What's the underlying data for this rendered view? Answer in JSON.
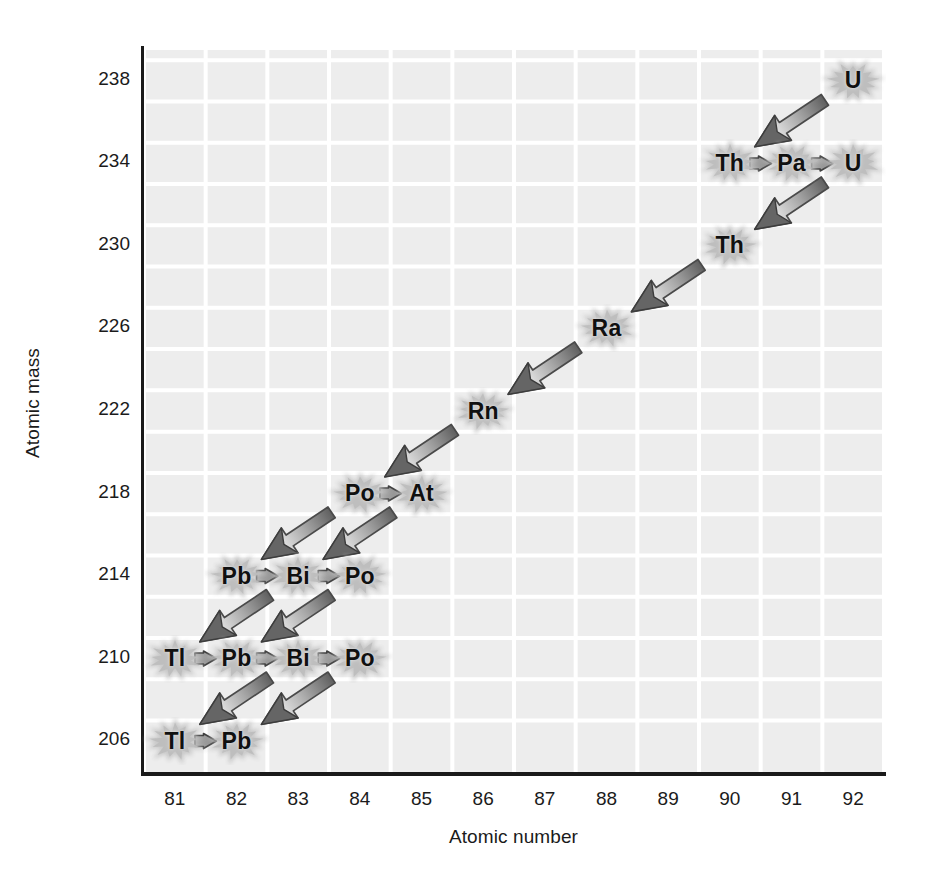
{
  "figure": {
    "background": "#ffffff",
    "panel_color": "#ededed",
    "grid_color": "#ffffff",
    "axis_color": "#1a1a1a"
  },
  "axes": {
    "xlabel": "Atomic number",
    "ylabel": "Atomic mass",
    "xticks": [
      "81",
      "82",
      "83",
      "84",
      "85",
      "86",
      "87",
      "88",
      "89",
      "90",
      "91",
      "92"
    ],
    "yticks": [
      "238",
      "234",
      "230",
      "226",
      "222",
      "218",
      "214",
      "210",
      "206"
    ],
    "xlim": [
      80.5,
      92.5
    ],
    "ylim": [
      204.5,
      239.5
    ]
  },
  "chart_data": {
    "type": "scatter",
    "xlabel": "Atomic number",
    "ylabel": "Atomic mass",
    "xlim": [
      80.5,
      92.5
    ],
    "ylim": [
      204.5,
      239.5
    ],
    "xticks": [
      81,
      82,
      83,
      84,
      85,
      86,
      87,
      88,
      89,
      90,
      91,
      92
    ],
    "yticks": [
      238,
      234,
      230,
      226,
      222,
      218,
      214,
      210,
      206
    ],
    "grid": true,
    "legend": "none",
    "nodes": [
      {
        "symbol": "U",
        "z": 92,
        "a": 238
      },
      {
        "symbol": "Th",
        "z": 90,
        "a": 234
      },
      {
        "symbol": "Pa",
        "z": 91,
        "a": 234
      },
      {
        "symbol": "U",
        "z": 92,
        "a": 234
      },
      {
        "symbol": "Th",
        "z": 90,
        "a": 230
      },
      {
        "symbol": "Ra",
        "z": 88,
        "a": 226
      },
      {
        "symbol": "Rn",
        "z": 86,
        "a": 222
      },
      {
        "symbol": "Po",
        "z": 84,
        "a": 218
      },
      {
        "symbol": "At",
        "z": 85,
        "a": 218
      },
      {
        "symbol": "Pb",
        "z": 82,
        "a": 214
      },
      {
        "symbol": "Bi",
        "z": 83,
        "a": 214
      },
      {
        "symbol": "Po",
        "z": 84,
        "a": 214
      },
      {
        "symbol": "Tl",
        "z": 81,
        "a": 210
      },
      {
        "symbol": "Pb",
        "z": 82,
        "a": 210
      },
      {
        "symbol": "Bi",
        "z": 83,
        "a": 210
      },
      {
        "symbol": "Po",
        "z": 84,
        "a": 210
      },
      {
        "symbol": "Tl",
        "z": 81,
        "a": 206
      },
      {
        "symbol": "Pb",
        "z": 82,
        "a": 206
      }
    ],
    "transitions": [
      {
        "kind": "alpha",
        "from": {
          "z": 92,
          "a": 238
        },
        "to": {
          "z": 90,
          "a": 234
        }
      },
      {
        "kind": "beta",
        "from": {
          "z": 90,
          "a": 234
        },
        "to": {
          "z": 91,
          "a": 234
        }
      },
      {
        "kind": "beta",
        "from": {
          "z": 91,
          "a": 234
        },
        "to": {
          "z": 92,
          "a": 234
        }
      },
      {
        "kind": "alpha",
        "from": {
          "z": 92,
          "a": 234
        },
        "to": {
          "z": 90,
          "a": 230
        }
      },
      {
        "kind": "alpha",
        "from": {
          "z": 90,
          "a": 230
        },
        "to": {
          "z": 88,
          "a": 226
        }
      },
      {
        "kind": "alpha",
        "from": {
          "z": 88,
          "a": 226
        },
        "to": {
          "z": 86,
          "a": 222
        }
      },
      {
        "kind": "alpha",
        "from": {
          "z": 86,
          "a": 222
        },
        "to": {
          "z": 84,
          "a": 218
        }
      },
      {
        "kind": "beta",
        "from": {
          "z": 84,
          "a": 218
        },
        "to": {
          "z": 85,
          "a": 218
        }
      },
      {
        "kind": "alpha",
        "from": {
          "z": 84,
          "a": 218
        },
        "to": {
          "z": 82,
          "a": 214
        }
      },
      {
        "kind": "alpha",
        "from": {
          "z": 85,
          "a": 218
        },
        "to": {
          "z": 83,
          "a": 214
        }
      },
      {
        "kind": "beta",
        "from": {
          "z": 82,
          "a": 214
        },
        "to": {
          "z": 83,
          "a": 214
        }
      },
      {
        "kind": "beta",
        "from": {
          "z": 83,
          "a": 214
        },
        "to": {
          "z": 84,
          "a": 214
        }
      },
      {
        "kind": "alpha",
        "from": {
          "z": 83,
          "a": 214
        },
        "to": {
          "z": 81,
          "a": 210
        }
      },
      {
        "kind": "alpha",
        "from": {
          "z": 84,
          "a": 214
        },
        "to": {
          "z": 82,
          "a": 210
        }
      },
      {
        "kind": "beta",
        "from": {
          "z": 81,
          "a": 210
        },
        "to": {
          "z": 82,
          "a": 210
        }
      },
      {
        "kind": "beta",
        "from": {
          "z": 82,
          "a": 210
        },
        "to": {
          "z": 83,
          "a": 210
        }
      },
      {
        "kind": "beta",
        "from": {
          "z": 83,
          "a": 210
        },
        "to": {
          "z": 84,
          "a": 210
        }
      },
      {
        "kind": "alpha",
        "from": {
          "z": 83,
          "a": 210
        },
        "to": {
          "z": 81,
          "a": 206
        }
      },
      {
        "kind": "alpha",
        "from": {
          "z": 84,
          "a": 210
        },
        "to": {
          "z": 82,
          "a": 206
        }
      },
      {
        "kind": "beta",
        "from": {
          "z": 81,
          "a": 206
        },
        "to": {
          "z": 82,
          "a": 206
        }
      }
    ]
  }
}
